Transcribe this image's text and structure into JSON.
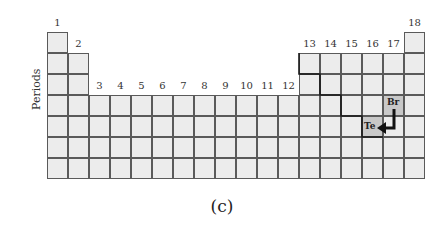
{
  "diagram": {
    "type": "periodic-table-outline",
    "groups": [
      "1",
      "2",
      "3",
      "4",
      "5",
      "6",
      "7",
      "8",
      "9",
      "10",
      "11",
      "12",
      "13",
      "14",
      "15",
      "16",
      "17",
      "18"
    ],
    "axis_label": "Periods",
    "caption": "(c)",
    "highlighted_elements": [
      {
        "symbol": "Te",
        "group": 16,
        "period": 5
      },
      {
        "symbol": "Br",
        "group": 17,
        "period": 4
      }
    ],
    "arrow": {
      "from": "Br",
      "to": "Te"
    },
    "colors": {
      "cell": "#ececec",
      "highlight": "#c8c8c8",
      "grid": "#5a5a5a",
      "staircase": "#1a1a1a"
    }
  }
}
